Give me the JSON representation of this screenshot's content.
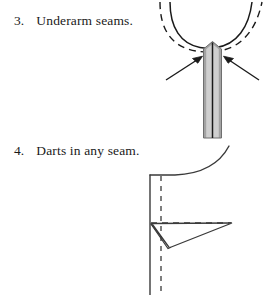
{
  "page": {
    "background": "#ffffff",
    "ink_color": "#1a1a1a",
    "width": 267,
    "height": 303
  },
  "list": {
    "items": [
      {
        "number": "3.",
        "label": "Underarm seams.",
        "figure": "underarm-seam-diagram"
      },
      {
        "number": "4.",
        "label": "Darts in any seam.",
        "figure": "dart-seam-diagram"
      }
    ]
  },
  "figures": {
    "underarm_seam": {
      "name": "underarm-seam-diagram",
      "description": "U-shaped armhole curve with dashed stitching line and a vertical pressed seam strip, two arrows pointing at the seam junction",
      "elements": {
        "solid_curve": "armhole-solid-curve",
        "dashed_curve": "armhole-dashed-curve",
        "seam_strip": "seam-allowance-strip",
        "seam_center_line": "seam-center-line",
        "arrow_left": "pointer-arrow-left",
        "arrow_right": "pointer-arrow-right"
      },
      "colors": {
        "strip_fill": "#cfcfcf",
        "strip_edge": "#9a9a9a",
        "line": "#1a1a1a"
      },
      "geometry": {
        "curve_left_top_x": 163,
        "curve_right_top_x": 258,
        "curve_bottom_y": 48,
        "strip_left_x": 203,
        "strip_right_x": 222,
        "strip_top_y": 45,
        "strip_bottom_y": 138
      }
    },
    "dart_seam": {
      "name": "dart-seam-diagram",
      "description": "Garment edge with curved hem, vertical seam line, dashed grain and dart center lines, and a narrow dart folded toward the seam",
      "elements": {
        "hem_curve": "hem-curve",
        "seam_line": "vertical-seam-line",
        "dashed_vertical": "dashed-center-line",
        "dashed_horizontal": "dashed-dart-center-line",
        "dart_triangle": "dart-triangle",
        "dart_fold": "dart-fold"
      },
      "colors": {
        "line": "#1a1a1a"
      },
      "geometry": {
        "seam_x": 150,
        "dashed_x": 161,
        "top_y": 175,
        "bottom_y": 295,
        "dart_apex_x": 232,
        "dart_apex_y": 223,
        "dart_top_y": 224,
        "dart_point_y": 248,
        "curve_start_x": 228,
        "curve_start_y": 147
      }
    }
  }
}
